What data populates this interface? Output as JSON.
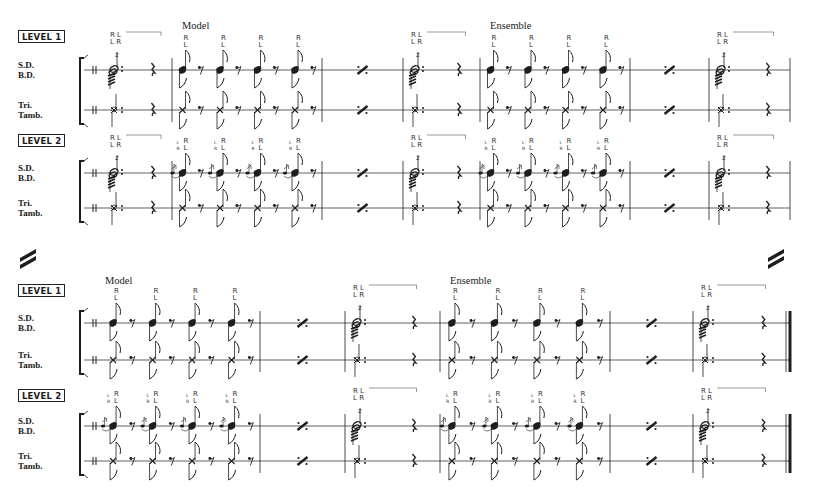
{
  "document": {
    "type": "percussion score excerpt",
    "system_break_symbol": "double-slash",
    "systems": [
      {
        "id": "top",
        "sections": [
          {
            "title": "Model",
            "anchor_measure": 2
          },
          {
            "title": "Ensemble",
            "anchor_measure": 5
          }
        ],
        "levels": [
          {
            "badge": "LEVEL 1",
            "instruments": [
              {
                "name": "S.D.\nB.D.",
                "label_line1": "S.D.",
                "label_line2": "B.D."
              },
              {
                "name": "Tri.\nTamb.",
                "label_line1": "Tri.",
                "label_line2": "Tamb."
              }
            ],
            "measures": [
              {
                "type": "roll",
                "sticking_top": "R L",
                "sticking_bottom": "L R"
              },
              {
                "type": "eighths",
                "count": 4,
                "sticking": [
                  [
                    "R",
                    "L"
                  ],
                  [
                    "R",
                    "L"
                  ],
                  [
                    "R",
                    "L"
                  ],
                  [
                    "R",
                    "L"
                  ]
                ],
                "flam": false
              },
              {
                "type": "repeat"
              },
              {
                "type": "roll",
                "sticking_top": "R L",
                "sticking_bottom": "L R"
              },
              {
                "type": "eighths",
                "count": 4,
                "sticking": [
                  [
                    "R",
                    "L"
                  ],
                  [
                    "R",
                    "L"
                  ],
                  [
                    "R",
                    "L"
                  ],
                  [
                    "R",
                    "L"
                  ]
                ],
                "flam": false
              },
              {
                "type": "repeat"
              },
              {
                "type": "roll",
                "sticking_top": "R L",
                "sticking_bottom": "L R",
                "final": false
              }
            ]
          },
          {
            "badge": "LEVEL 2",
            "instruments": [
              {
                "label_line1": "S.D.",
                "label_line2": "B.D."
              },
              {
                "label_line1": "Tri.",
                "label_line2": "Tamb."
              }
            ],
            "measures": [
              {
                "type": "roll",
                "sticking_top": "R L",
                "sticking_bottom": "L R"
              },
              {
                "type": "eighths",
                "count": 4,
                "sticking": [
                  [
                    "R",
                    "L"
                  ],
                  [
                    "R",
                    "L"
                  ],
                  [
                    "R",
                    "L"
                  ],
                  [
                    "R",
                    "L"
                  ]
                ],
                "grace": [
                  [
                    "L",
                    "R"
                  ],
                  [
                    "L",
                    "R"
                  ],
                  [
                    "L",
                    "R"
                  ],
                  [
                    "L",
                    "R"
                  ]
                ],
                "flam": true
              },
              {
                "type": "repeat"
              },
              {
                "type": "roll",
                "sticking_top": "R L",
                "sticking_bottom": "L R"
              },
              {
                "type": "eighths",
                "count": 4,
                "sticking": [
                  [
                    "R",
                    "L"
                  ],
                  [
                    "R",
                    "L"
                  ],
                  [
                    "R",
                    "L"
                  ],
                  [
                    "R",
                    "L"
                  ]
                ],
                "grace": [
                  [
                    "L",
                    "R"
                  ],
                  [
                    "L",
                    "R"
                  ],
                  [
                    "L",
                    "R"
                  ],
                  [
                    "L",
                    "R"
                  ]
                ],
                "flam": true
              },
              {
                "type": "repeat"
              },
              {
                "type": "roll",
                "sticking_top": "R L",
                "sticking_bottom": "L R",
                "final": false
              }
            ]
          }
        ]
      },
      {
        "id": "bottom",
        "sections": [
          {
            "title": "Model",
            "anchor_measure": 1
          },
          {
            "title": "Ensemble",
            "anchor_measure": 4
          }
        ],
        "levels": [
          {
            "badge": "LEVEL 1",
            "instruments": [
              {
                "label_line1": "S.D.",
                "label_line2": "B.D."
              },
              {
                "label_line1": "Tri.",
                "label_line2": "Tamb."
              }
            ],
            "measures": [
              {
                "type": "eighths",
                "count": 4,
                "sticking": [
                  [
                    "R",
                    "L"
                  ],
                  [
                    "R",
                    "L"
                  ],
                  [
                    "R",
                    "L"
                  ],
                  [
                    "R",
                    "L"
                  ]
                ],
                "flam": false
              },
              {
                "type": "repeat"
              },
              {
                "type": "roll",
                "sticking_top": "R L",
                "sticking_bottom": "L R"
              },
              {
                "type": "eighths",
                "count": 4,
                "sticking": [
                  [
                    "R",
                    "L"
                  ],
                  [
                    "R",
                    "L"
                  ],
                  [
                    "R",
                    "L"
                  ],
                  [
                    "R",
                    "L"
                  ]
                ],
                "flam": false
              },
              {
                "type": "repeat"
              },
              {
                "type": "roll",
                "sticking_top": "R L",
                "sticking_bottom": "L R",
                "final": true
              }
            ]
          },
          {
            "badge": "LEVEL 2",
            "instruments": [
              {
                "label_line1": "S.D.",
                "label_line2": "B.D."
              },
              {
                "label_line1": "Tri.",
                "label_line2": "Tamb."
              }
            ],
            "measures": [
              {
                "type": "eighths",
                "count": 4,
                "sticking": [
                  [
                    "R",
                    "L"
                  ],
                  [
                    "R",
                    "L"
                  ],
                  [
                    "R",
                    "L"
                  ],
                  [
                    "R",
                    "L"
                  ]
                ],
                "grace": [
                  [
                    "L",
                    "R"
                  ],
                  [
                    "L",
                    "R"
                  ],
                  [
                    "L",
                    "R"
                  ],
                  [
                    "L",
                    "R"
                  ]
                ],
                "flam": true
              },
              {
                "type": "repeat"
              },
              {
                "type": "roll",
                "sticking_top": "R L",
                "sticking_bottom": "L R"
              },
              {
                "type": "eighths",
                "count": 4,
                "sticking": [
                  [
                    "R",
                    "L"
                  ],
                  [
                    "R",
                    "L"
                  ],
                  [
                    "R",
                    "L"
                  ],
                  [
                    "R",
                    "L"
                  ]
                ],
                "grace": [
                  [
                    "L",
                    "R"
                  ],
                  [
                    "L",
                    "R"
                  ],
                  [
                    "L",
                    "R"
                  ],
                  [
                    "L",
                    "R"
                  ]
                ],
                "flam": true
              },
              {
                "type": "repeat"
              },
              {
                "type": "roll",
                "sticking_top": "R L",
                "sticking_bottom": "L R",
                "final": true
              }
            ]
          }
        ]
      }
    ]
  }
}
